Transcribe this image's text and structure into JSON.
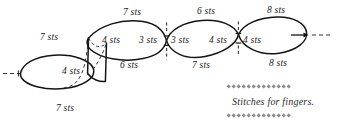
{
  "figure": {
    "stroke_color": "#141414",
    "dash_color": "#333333",
    "labels": {
      "left_loop_top": "7 sts",
      "left_loop_bottom": "7 sts",
      "left_loop_inner": "4 sts",
      "cyl_inner": "4 sts",
      "loop2_top": "7 sts",
      "loop2_bottom": "6 sts",
      "loop2_inner_right": "3 sts",
      "loop3_inner_left": "3 sts",
      "loop3_top": "6 sts",
      "loop3_bottom": "7 sts",
      "loop3_inner_right": "4 sts",
      "loop4_inner_left": "4 sts",
      "loop4_top": "8 sts",
      "loop4_bottom": "8 sts"
    }
  },
  "legend": {
    "caption": "Stitches for fingers.",
    "ornament_color": "#8c8c8c",
    "ornament_count": 13,
    "ornament_shape": "diamond"
  }
}
